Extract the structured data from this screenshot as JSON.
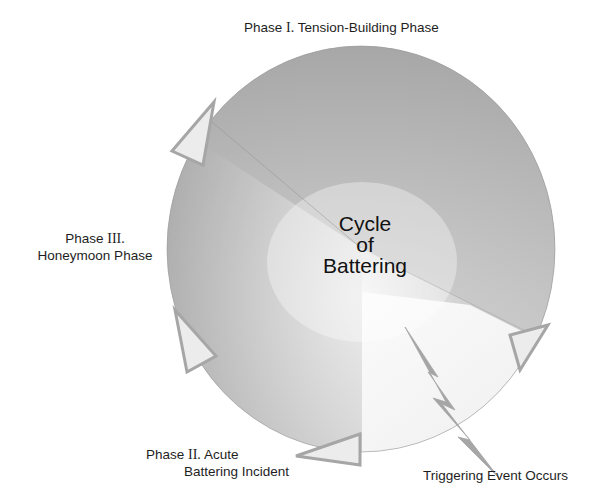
{
  "diagram": {
    "title_center": {
      "line1": "Cycle",
      "line2": "of",
      "line3": "Battering"
    },
    "phases": [
      {
        "id": "phase-1",
        "prefix": "Phase",
        "roman": "I.",
        "name": "Tension-Building Phase",
        "fill": "#a9a9a9"
      },
      {
        "id": "phase-2",
        "prefix": "Phase",
        "roman": "II.",
        "name_line1": "Acute",
        "name_line2": "Battering Incident",
        "fill": "#bdbdbd"
      },
      {
        "id": "phase-3",
        "prefix": "Phase",
        "roman": "III.",
        "name": "Honeymoon Phase",
        "fill": "#b3b3b3"
      }
    ],
    "trigger": {
      "label": "Triggering Event Occurs",
      "icon": "lightning-bolt-icon",
      "fill": "#f2f2f2"
    },
    "colors": {
      "circle_dark": "#9c9c9c",
      "circle_light": "#f4f4f4",
      "arrow_fill": "#ededed",
      "arrow_stroke": "#a8a8a8",
      "bolt": "#a0a0a0",
      "text": "#1e1e1e"
    },
    "arrows": [
      {
        "name": "arrow-upper-left",
        "position": "between phase III and phase I"
      },
      {
        "name": "arrow-left",
        "position": "within phase III"
      },
      {
        "name": "arrow-bottom",
        "position": "between phase II and trigger"
      },
      {
        "name": "arrow-right",
        "position": "between trigger and phase I"
      }
    ]
  }
}
